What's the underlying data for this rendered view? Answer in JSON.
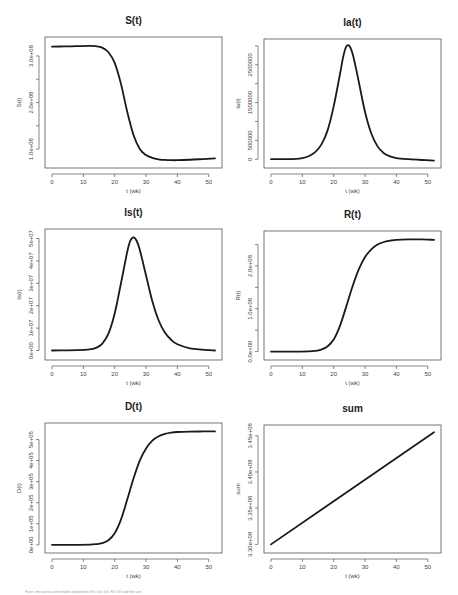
{
  "figure": {
    "caption": "Figure: time courses of the model compartments S(t), Ia(t), Is(t), R(t), D(t) and their sum"
  },
  "chart_data": [
    {
      "id": "S",
      "type": "line",
      "title": "S(t)",
      "xlabel": "t (wk)",
      "ylabel": "S(t)",
      "xlim": [
        0,
        52
      ],
      "ylim": [
        70000000,
        330000000
      ],
      "xticks": [
        0,
        10,
        20,
        30,
        40,
        50
      ],
      "yticks": [
        100000000,
        150000000,
        200000000,
        250000000,
        300000000
      ],
      "ytick_labels": [
        "1.0e+08",
        "",
        "2.0e+08",
        "",
        "3.0e+08"
      ],
      "grid": false,
      "x": [
        0,
        4,
        8,
        12,
        14,
        16,
        18,
        20,
        22,
        24,
        26,
        28,
        30,
        32,
        34,
        36,
        38,
        40,
        44,
        48,
        52
      ],
      "values": [
        320000000,
        320500000,
        321000000,
        321500000,
        321000000,
        318000000,
        308000000,
        285000000,
        240000000,
        180000000,
        130000000,
        100000000,
        87000000,
        81000000,
        78000000,
        76500000,
        76000000,
        76000000,
        77000000,
        78500000,
        80000000
      ]
    },
    {
      "id": "Ia",
      "type": "line",
      "title": "Ia(t)",
      "xlabel": "t (wk)",
      "ylabel": "Ia(t)",
      "xlim": [
        0,
        52
      ],
      "ylim": [
        -100000,
        3050000
      ],
      "xticks": [
        0,
        10,
        20,
        30,
        40,
        50
      ],
      "yticks": [
        0,
        500000,
        1000000,
        1500000,
        2000000,
        2500000,
        3000000
      ],
      "ytick_labels": [
        "0",
        "500000",
        "",
        "1500000",
        "",
        "2500000",
        ""
      ],
      "grid": false,
      "x": [
        0,
        4,
        8,
        10,
        12,
        14,
        16,
        18,
        20,
        22,
        23,
        24,
        25,
        26,
        27,
        28,
        30,
        32,
        34,
        36,
        38,
        40,
        44,
        48,
        52
      ],
      "values": [
        0,
        2000,
        10000,
        30000,
        80000,
        180000,
        380000,
        750000,
        1400000,
        2250000,
        2700000,
        2980000,
        3000000,
        2800000,
        2450000,
        2050000,
        1250000,
        680000,
        340000,
        160000,
        75000,
        30000,
        0,
        -20000,
        -35000
      ]
    },
    {
      "id": "Is",
      "type": "line",
      "title": "Is(t)",
      "xlabel": "t (wk)",
      "ylabel": "Is(t)",
      "xlim": [
        0,
        52
      ],
      "ylim": [
        -2000000,
        52000000
      ],
      "xticks": [
        0,
        10,
        20,
        30,
        40,
        50
      ],
      "yticks": [
        0,
        10000000,
        20000000,
        30000000,
        40000000,
        50000000
      ],
      "ytick_labels": [
        "0e+00",
        "1e+07",
        "2e+07",
        "3e+07",
        "4e+07",
        "5e+07"
      ],
      "grid": false,
      "x": [
        0,
        4,
        8,
        12,
        14,
        16,
        18,
        20,
        22,
        24,
        25,
        26,
        27,
        28,
        30,
        32,
        34,
        36,
        38,
        40,
        44,
        48,
        52
      ],
      "values": [
        0,
        50000,
        150000,
        500000,
        1200000,
        3000000,
        7500000,
        16500000,
        30000000,
        44000000,
        49000000,
        50500000,
        49000000,
        45000000,
        33500000,
        22000000,
        13500000,
        8000000,
        4800000,
        2800000,
        1000000,
        400000,
        0
      ]
    },
    {
      "id": "R",
      "type": "line",
      "title": "R(t)",
      "xlabel": "t (wk)",
      "ylabel": "R(t)",
      "xlim": [
        0,
        52
      ],
      "ylim": [
        -8000000,
        270000000
      ],
      "xticks": [
        0,
        10,
        20,
        30,
        40,
        50
      ],
      "yticks": [
        0,
        50000000,
        100000000,
        150000000,
        200000000,
        250000000
      ],
      "ytick_labels": [
        "0.0e+00",
        "",
        "1.0e+08",
        "",
        "2.0e+08",
        ""
      ],
      "grid": false,
      "x": [
        0,
        4,
        8,
        12,
        14,
        16,
        18,
        20,
        22,
        24,
        26,
        28,
        30,
        32,
        34,
        36,
        38,
        40,
        44,
        48,
        52
      ],
      "values": [
        0,
        0,
        100000,
        500000,
        1500000,
        4500000,
        12000000,
        28000000,
        60000000,
        105000000,
        152000000,
        192000000,
        221000000,
        239000000,
        250000000,
        256000000,
        259000000,
        261000000,
        262000000,
        262000000,
        261000000
      ]
    },
    {
      "id": "D",
      "type": "line",
      "title": "D(t)",
      "xlabel": "t (wk)",
      "ylabel": "D(t)",
      "xlim": [
        0,
        52
      ],
      "ylim": [
        -15000,
        555000
      ],
      "xticks": [
        0,
        10,
        20,
        30,
        40,
        50
      ],
      "yticks": [
        0,
        100000,
        200000,
        300000,
        400000,
        500000
      ],
      "ytick_labels": [
        "0e+00",
        "1e+05",
        "2e+05",
        "3e+05",
        "4e+05",
        "5e+05"
      ],
      "grid": false,
      "x": [
        0,
        4,
        8,
        12,
        14,
        16,
        18,
        20,
        22,
        24,
        26,
        28,
        30,
        32,
        34,
        36,
        38,
        40,
        44,
        48,
        52
      ],
      "values": [
        0,
        0,
        200,
        1000,
        3000,
        8000,
        22000,
        55000,
        120000,
        215000,
        315000,
        400000,
        458000,
        495000,
        516000,
        527000,
        533000,
        536000,
        538000,
        538500,
        538500
      ]
    },
    {
      "id": "sum",
      "type": "line",
      "title": "sum",
      "xlabel": "t (wk)",
      "ylabel": "sum",
      "xlim": [
        0,
        52
      ],
      "ylim": [
        329500000,
        345800000
      ],
      "xticks": [
        0,
        10,
        20,
        30,
        40,
        50
      ],
      "yticks": [
        330000000,
        335000000,
        340000000,
        345000000
      ],
      "ytick_labels": [
        "3.30e+08",
        "3.35e+08",
        "3.40e+08",
        "3.45e+08"
      ],
      "grid": false,
      "x": [
        0,
        52
      ],
      "values": [
        330000000,
        345500000
      ]
    }
  ]
}
